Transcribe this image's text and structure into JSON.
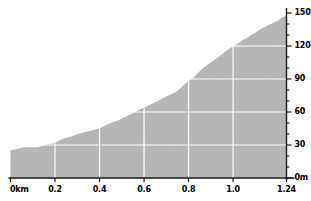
{
  "chart_data": {
    "type": "area",
    "title": "",
    "subtitle": "",
    "xlabel": "",
    "ylabel": "",
    "xlim": [
      0,
      1.24
    ],
    "ylim": [
      0,
      150
    ],
    "grid": true,
    "legend": null,
    "x_unit": "km",
    "y_unit": "m",
    "x_ticks": [
      {
        "value": 0,
        "label": "0km"
      },
      {
        "value": 0.2,
        "label": "0.2"
      },
      {
        "value": 0.4,
        "label": "0.4"
      },
      {
        "value": 0.6,
        "label": "0.6"
      },
      {
        "value": 0.8,
        "label": "0.8"
      },
      {
        "value": 1.0,
        "label": "1.0"
      },
      {
        "value": 1.24,
        "label": "1.24"
      }
    ],
    "y_ticks": [
      {
        "value": 0,
        "label": "0m"
      },
      {
        "value": 30,
        "label": "30"
      },
      {
        "value": 60,
        "label": "60"
      },
      {
        "value": 90,
        "label": "90"
      },
      {
        "value": 120,
        "label": "120"
      },
      {
        "value": 150,
        "label": "150"
      }
    ],
    "y_minor_tick_step": 10,
    "gridlines_x": [
      0.2,
      0.4,
      0.6,
      0.8,
      1.0
    ],
    "gridlines_y": [
      30,
      60,
      90,
      120
    ],
    "fill_color": "#b5b5b5",
    "grid_color": "#ffffff",
    "axis_color": "#1a1a1a",
    "background_color": "#ffffff",
    "series": [
      {
        "name": "Elevation profile",
        "x": [
          0.0,
          0.02,
          0.04,
          0.06,
          0.08,
          0.1,
          0.12,
          0.14,
          0.16,
          0.18,
          0.2,
          0.22,
          0.24,
          0.26,
          0.28,
          0.3,
          0.32,
          0.34,
          0.36,
          0.38,
          0.4,
          0.42,
          0.44,
          0.46,
          0.48,
          0.5,
          0.52,
          0.54,
          0.56,
          0.58,
          0.6,
          0.62,
          0.64,
          0.66,
          0.68,
          0.7,
          0.72,
          0.74,
          0.76,
          0.78,
          0.8,
          0.82,
          0.84,
          0.86,
          0.88,
          0.9,
          0.92,
          0.94,
          0.96,
          0.98,
          1.0,
          1.02,
          1.04,
          1.06,
          1.08,
          1.1,
          1.12,
          1.14,
          1.16,
          1.18,
          1.2,
          1.22,
          1.24
        ],
        "y": [
          25,
          26,
          27,
          28,
          28,
          28,
          28,
          29,
          30,
          31,
          32,
          34,
          36,
          37,
          38,
          40,
          41,
          42,
          43,
          44,
          45,
          47,
          49,
          51,
          52,
          54,
          56,
          58,
          60,
          62,
          64,
          66,
          68,
          70,
          72,
          74,
          76,
          78,
          81,
          85,
          88,
          91,
          95,
          99,
          102,
          105,
          108,
          111,
          114,
          117,
          120,
          122,
          125,
          127,
          130,
          132,
          135,
          137,
          139,
          141,
          143,
          146,
          148
        ]
      }
    ]
  }
}
